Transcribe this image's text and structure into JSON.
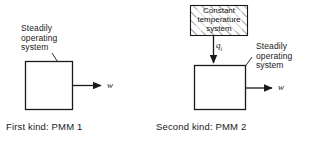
{
  "figure": {
    "background_color": "#ffffff",
    "line_color": "#1a1a1a"
  },
  "diagrams": [
    {
      "id": "pmm1",
      "caption": "First kind: PMM 1",
      "system_label": "Steadily\noperating\nsystem",
      "work_output_label": "w",
      "heat_input_label": null,
      "source_label": null
    },
    {
      "id": "pmm2",
      "caption": "Second kind: PMM 2",
      "system_label": "Steadily\noperating\nsystem",
      "work_output_label": "w",
      "heat_input_label": "q",
      "heat_input_subscript": "i",
      "source_label": "Constant\ntemperature\nsystem"
    }
  ]
}
